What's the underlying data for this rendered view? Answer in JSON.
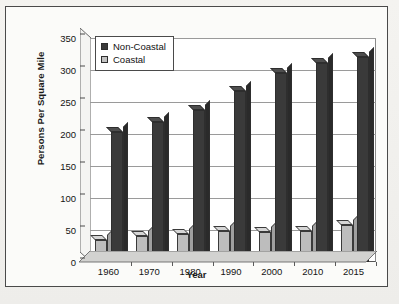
{
  "chart_data": {
    "type": "bar",
    "title": "",
    "xlabel": "Year",
    "ylabel": "Persons Per Square Mile",
    "categories": [
      "1960",
      "1970",
      "1980",
      "1990",
      "2000",
      "2010",
      "2015"
    ],
    "series": [
      {
        "name": "Non-Coastal",
        "values": [
          35,
          40,
          44,
          48,
          47,
          48,
          58
        ],
        "color": "#bdbdbd"
      },
      {
        "name": "Coastal",
        "values": [
          203,
          218,
          238,
          267,
          295,
          311,
          320
        ],
        "color": "#3a3a3a"
      }
    ],
    "series_render_order": [
      "Coastal-light-front",
      "NonCoastal-dark-back"
    ],
    "plot_series": [
      {
        "key": "coastal_light",
        "legend_label": "Coastal",
        "swatch": "light",
        "values": [
          35,
          40,
          44,
          48,
          47,
          48,
          58
        ]
      },
      {
        "key": "noncoastal_dark",
        "legend_label": "Non-Coastal",
        "swatch": "dark",
        "values": [
          203,
          218,
          238,
          267,
          295,
          311,
          320
        ]
      }
    ],
    "ylim": [
      0,
      350
    ],
    "ytick_values": [
      0,
      50,
      100,
      150,
      200,
      250,
      300,
      350
    ],
    "ytick_labels": [
      "0",
      "50",
      "100",
      "150",
      "200",
      "250",
      "300",
      "350"
    ],
    "ytick_step": 50,
    "grid": true,
    "grid_axis": "y",
    "legend_position": "top-left-inside",
    "style": "3d-column",
    "colors": {
      "non_coastal": "#3a3a3a",
      "coastal": "#bdbdbd",
      "axis": "#4a4a4a",
      "gridline": "#9a9a9a",
      "plot_background": "#ffffff",
      "page_background": "#f2f1ee",
      "frame_border": "#4a4a4a",
      "text": "#141414"
    }
  },
  "axes": {
    "y_title": "Persons Per Square Mile",
    "x_title": "Year"
  },
  "legend": {
    "items": [
      {
        "label": "Non-Coastal",
        "swatch": "dark"
      },
      {
        "label": "Coastal",
        "swatch": "light"
      }
    ]
  }
}
